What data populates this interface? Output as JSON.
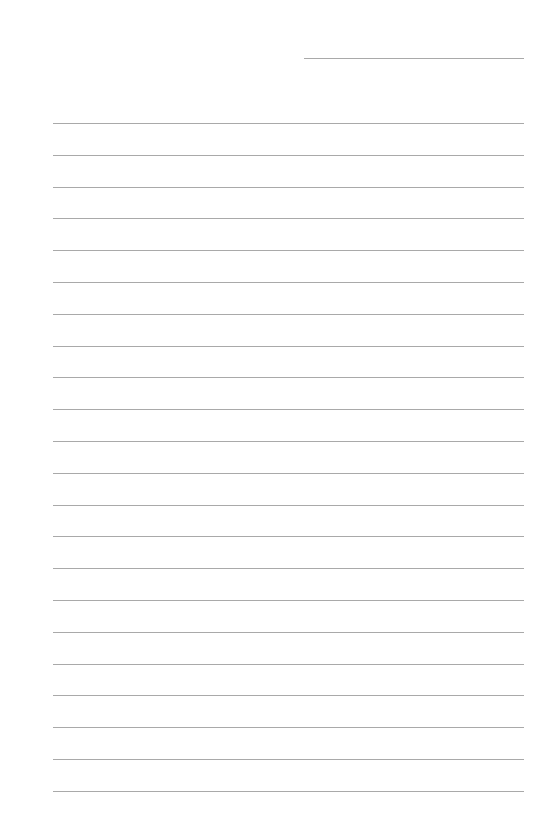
{
  "document": {
    "type": "lined-paper",
    "background_color": "#ffffff",
    "line_color": "#a9a9a9",
    "header_field": {
      "label": "",
      "value": ""
    },
    "ruled_lines": {
      "count": 22,
      "first_top_px": 123,
      "spacing_px": 31.8,
      "lines": [
        {
          "index": 1,
          "text": ""
        },
        {
          "index": 2,
          "text": ""
        },
        {
          "index": 3,
          "text": ""
        },
        {
          "index": 4,
          "text": ""
        },
        {
          "index": 5,
          "text": ""
        },
        {
          "index": 6,
          "text": ""
        },
        {
          "index": 7,
          "text": ""
        },
        {
          "index": 8,
          "text": ""
        },
        {
          "index": 9,
          "text": ""
        },
        {
          "index": 10,
          "text": ""
        },
        {
          "index": 11,
          "text": ""
        },
        {
          "index": 12,
          "text": ""
        },
        {
          "index": 13,
          "text": ""
        },
        {
          "index": 14,
          "text": ""
        },
        {
          "index": 15,
          "text": ""
        },
        {
          "index": 16,
          "text": ""
        },
        {
          "index": 17,
          "text": ""
        },
        {
          "index": 18,
          "text": ""
        },
        {
          "index": 19,
          "text": ""
        },
        {
          "index": 20,
          "text": ""
        },
        {
          "index": 21,
          "text": ""
        },
        {
          "index": 22,
          "text": ""
        }
      ]
    }
  }
}
